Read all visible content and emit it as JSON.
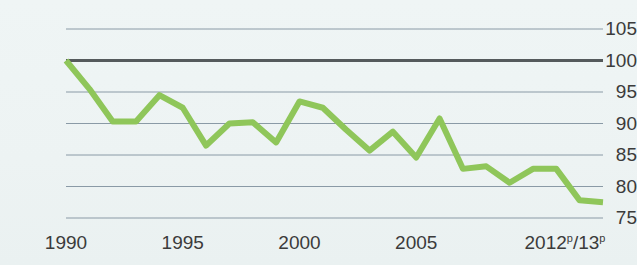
{
  "chart_data": {
    "type": "line",
    "title": "",
    "subtitle": "",
    "xlabel": "",
    "ylabel": "",
    "grid": true,
    "legend": "none",
    "baseline_value": 100,
    "xlim": [
      1990,
      2013
    ],
    "ylim": [
      75,
      105
    ],
    "y_ticks": [
      105,
      100,
      95,
      90,
      85,
      80,
      75
    ],
    "y_tick_labels": [
      "105",
      "100",
      "95",
      "90",
      "85",
      "80",
      "75"
    ],
    "x_ticks": [
      1990,
      1995,
      2000,
      2005,
      2013
    ],
    "x_tick_labels": [
      "1990",
      "1995",
      "2000",
      "2005",
      "2012ᵖ/13ᵖ"
    ],
    "x_tick_labels_html": [
      "1990",
      "1995",
      "2000",
      "2005",
      "2012<sup>p</sup>/13<sup>p</sup>"
    ],
    "x": [
      1990,
      1991,
      1992,
      1993,
      1994,
      1995,
      1996,
      1997,
      1998,
      1999,
      2000,
      2001,
      2002,
      2003,
      2004,
      2005,
      2006,
      2007,
      2008,
      2009,
      2010,
      2011,
      2012,
      2013
    ],
    "categories": [
      "1990",
      "1991",
      "1992",
      "1993",
      "1994",
      "1995",
      "1996",
      "1997",
      "1998",
      "1999",
      "2000",
      "2001",
      "2002",
      "2003",
      "2004",
      "2005",
      "2006",
      "2007",
      "2008",
      "2009",
      "2010",
      "2011",
      "2012ᵖ",
      "2013ᵖ"
    ],
    "values": [
      100.0,
      95.5,
      90.3,
      90.3,
      94.5,
      92.5,
      86.5,
      90.0,
      90.2,
      87.0,
      93.5,
      92.5,
      89.0,
      85.7,
      88.7,
      84.6,
      90.8,
      82.8,
      83.2,
      80.6,
      82.8,
      82.8,
      77.8,
      77.5
    ],
    "series": [
      {
        "name": "index",
        "color": "#8fc65a",
        "line_width": 6,
        "values": [
          100.0,
          95.5,
          90.3,
          90.3,
          94.5,
          92.5,
          86.5,
          90.0,
          90.2,
          87.0,
          93.5,
          92.5,
          89.0,
          85.7,
          88.7,
          84.6,
          90.8,
          82.8,
          83.2,
          80.6,
          82.8,
          82.8,
          77.8,
          77.5
        ]
      }
    ],
    "colors": {
      "line": "#8fc65a",
      "background": "#eef4f4",
      "gridline": "#8a9aa6",
      "baseline": "#555a5c",
      "tick_text": "#3b3b3b"
    }
  }
}
